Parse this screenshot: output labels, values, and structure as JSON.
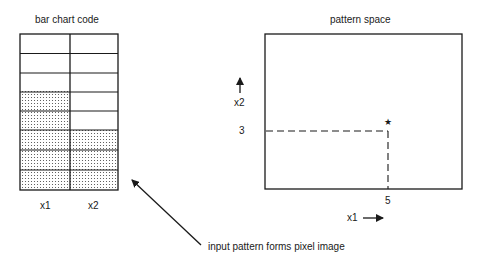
{
  "left_panel": {
    "title": "bar chart code",
    "columns": [
      {
        "label": "x1",
        "value": 5
      },
      {
        "label": "x2",
        "value": 3
      }
    ],
    "rows": 8
  },
  "right_panel": {
    "title": "pattern space",
    "y_axis_label": "x2",
    "x_axis_label": "x1",
    "y_tick": "3",
    "x_tick": "5",
    "point_marker": "★"
  },
  "caption": "input pattern forms pixel image",
  "colors": {
    "line": "#1a1a1a",
    "dot": "#444444",
    "background": "#ffffff"
  }
}
